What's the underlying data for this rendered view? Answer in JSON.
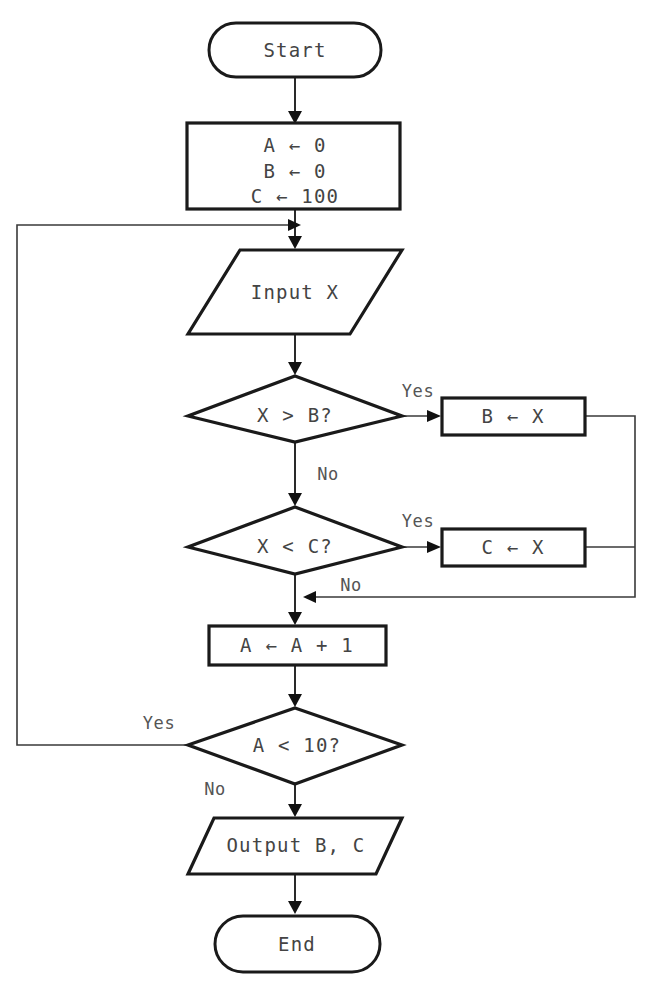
{
  "diagram": {
    "type": "flowchart",
    "orientation": "top-to-bottom",
    "background_color": "#ffffff",
    "line_color": "#1a1a1a",
    "text_color": "#444444"
  },
  "nodes": {
    "start": {
      "label": "Start",
      "shape": "terminal"
    },
    "init": {
      "shape": "process",
      "line1": "A ← 0",
      "line2": "B ← 0",
      "line3": "C ← 100"
    },
    "input": {
      "label": "Input X",
      "shape": "parallelogram-io"
    },
    "decision_max": {
      "label": "X > B?",
      "shape": "decision"
    },
    "assign_b": {
      "label": "B ← X",
      "shape": "process"
    },
    "decision_min": {
      "label": "X < C?",
      "shape": "decision"
    },
    "assign_c": {
      "label": "C ← X",
      "shape": "process"
    },
    "increment": {
      "label": "A ← A + 1",
      "shape": "process"
    },
    "decision_loop": {
      "label": "A < 10?",
      "shape": "decision"
    },
    "output": {
      "label": "Output B, C",
      "shape": "parallelogram-io"
    },
    "end": {
      "label": "End",
      "shape": "terminal"
    }
  },
  "edge_labels": {
    "max_yes": "Yes",
    "max_no": "No",
    "min_yes": "Yes",
    "min_no": "No",
    "loop_yes": "Yes",
    "loop_no": "No"
  }
}
